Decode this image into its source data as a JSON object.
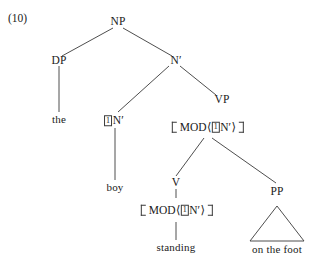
{
  "example": {
    "number": "(10)"
  },
  "tree": {
    "nodes": {
      "np": "NP",
      "dp": "DP",
      "nbar_top": "N′",
      "the": "the",
      "nbar_indexed_label": "N′",
      "nbar_indexed_index": "1",
      "boy": "boy",
      "vp": "VP",
      "v": "V",
      "pp": "PP",
      "standing": "standing",
      "on_the_foot": "on the foot"
    },
    "matrices": {
      "vp_mod": {
        "feature": "MOD",
        "open_angle": "⟨",
        "index": "1",
        "value": "N′",
        "close_angle": "⟩"
      },
      "v_mod": {
        "feature": "MOD",
        "open_angle": "⟨",
        "index": "1",
        "value": "N′",
        "close_angle": "⟩"
      }
    }
  },
  "colors": {
    "ink": "#1a1a1a",
    "line": "#3a3a3a",
    "background": "#ffffff"
  }
}
